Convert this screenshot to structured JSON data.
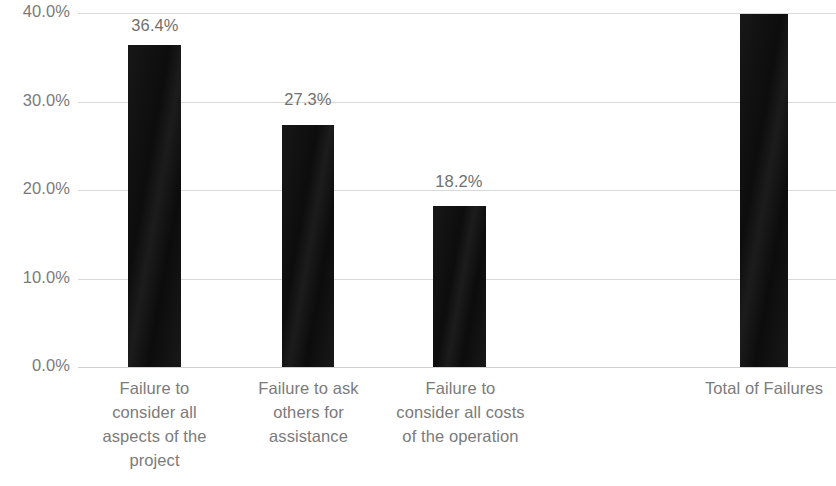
{
  "chart_data": {
    "type": "bar",
    "title": "",
    "subtitle": "",
    "xlabel": "",
    "ylabel": "",
    "ylim": [
      0,
      40
    ],
    "grid": true,
    "legend": "none",
    "orientation": "vertical",
    "bar_color": "#121212",
    "axis_text_color": "#7b7b7b",
    "gridline_color": "#d9d9d9",
    "background": "#ffffff",
    "y_ticks": [
      {
        "value": 40,
        "label": "40.0%"
      },
      {
        "value": 30,
        "label": "30.0%"
      },
      {
        "value": 20,
        "label": "20.0%"
      },
      {
        "value": 10,
        "label": "10.0%"
      },
      {
        "value": 0,
        "label": "0.0%"
      }
    ],
    "categories": [
      "Failure to consider all aspects of the project",
      "Failure to ask others for assistance",
      "Failure to consider all costs of the operation",
      "Total of Failures"
    ],
    "category_lines": [
      [
        "Failure to",
        "consider all",
        "aspects of the",
        "project"
      ],
      [
        "Failure to ask",
        "others for",
        "assistance"
      ],
      [
        "Failure to",
        "consider all costs",
        "of the operation"
      ],
      [
        "Total of Failures"
      ]
    ],
    "values": [
      36.4,
      27.3,
      18.2,
      39.9
    ],
    "data_labels": [
      "36.4%",
      "27.3%",
      "18.2%",
      ""
    ],
    "bars": [
      {
        "category": "Failure to consider all aspects of the project",
        "value": 36.4,
        "label": "36.4%",
        "x": 128,
        "width": 53
      },
      {
        "category": "Failure to ask others for assistance",
        "value": 27.3,
        "label": "27.3%",
        "x": 282,
        "width": 52
      },
      {
        "category": "Failure to consider all costs of the operation",
        "value": 18.2,
        "label": "18.2%",
        "x": 433,
        "width": 53
      },
      {
        "category": "Total of Failures",
        "value": 39.9,
        "label": "",
        "x": 740,
        "width": 48
      }
    ],
    "label_positions": [
      {
        "left": 96,
        "top": 16,
        "width": 118
      },
      {
        "left": 249,
        "top": 90,
        "width": 118
      },
      {
        "left": 400,
        "top": 172,
        "width": 118
      }
    ],
    "category_positions": [
      {
        "left": 84,
        "width": 141
      },
      {
        "left": 238,
        "width": 141
      },
      {
        "left": 388,
        "width": 145
      },
      {
        "left": 668,
        "width": 192
      }
    ]
  }
}
